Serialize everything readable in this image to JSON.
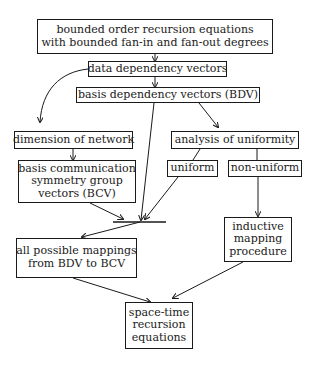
{
  "diagram": {
    "title": "",
    "nodes": {
      "recursion_equations": {
        "lines": [
          "bounded order recursion equations",
          "with bounded fan-in and fan-out degrees"
        ]
      },
      "data_dependency": {
        "lines": [
          "data dependency vectors"
        ]
      },
      "bdv": {
        "lines": [
          "basis dependency vectors (BDV)"
        ]
      },
      "dimension": {
        "lines": [
          "dimension of network"
        ]
      },
      "bcv": {
        "lines": [
          "basis communication",
          "symmetry group",
          "vectors (BCV)"
        ]
      },
      "analysis": {
        "lines": [
          "analysis of uniformity"
        ]
      },
      "uniform": {
        "lines": [
          "uniform"
        ]
      },
      "non_uniform": {
        "lines": [
          "non-uniform"
        ]
      },
      "all_mappings": {
        "lines": [
          "all possible mappings",
          "from BDV to BCV"
        ]
      },
      "inductive": {
        "lines": [
          "inductive",
          "mapping",
          "procedure"
        ]
      },
      "space_time": {
        "lines": [
          "space-time",
          "recursion",
          "equations"
        ]
      }
    },
    "edges": [
      {
        "from": "recursion_equations",
        "to": "data_dependency"
      },
      {
        "from": "data_dependency",
        "to": "bdv"
      },
      {
        "from": "data_dependency",
        "to": "dimension"
      },
      {
        "from": "dimension",
        "to": "bcv"
      },
      {
        "from": "bdv",
        "to": "analysis"
      },
      {
        "from": "bdv",
        "to": "junction"
      },
      {
        "from": "bcv",
        "to": "junction"
      },
      {
        "from": "analysis",
        "to": "uniform"
      },
      {
        "from": "uniform",
        "to": "junction"
      },
      {
        "from": "analysis",
        "to": "non_uniform"
      },
      {
        "from": "non_uniform",
        "to": "inductive"
      },
      {
        "from": "junction",
        "to": "all_mappings"
      },
      {
        "from": "all_mappings",
        "to": "space_time"
      },
      {
        "from": "inductive",
        "to": "space_time"
      }
    ],
    "colors": {
      "stroke": "#1a1a1a",
      "background": "#ffffff"
    }
  }
}
